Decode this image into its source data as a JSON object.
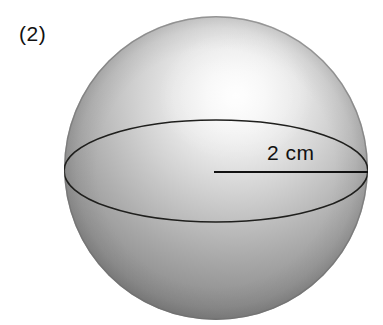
{
  "figure": {
    "type": "geometry-diagram",
    "shape": "sphere",
    "item_number": "(2)",
    "background_color": "#ffffff",
    "width": 383,
    "height": 325
  },
  "labels": {
    "item_number": "(2)",
    "radius_measure": "2 cm"
  },
  "sphere": {
    "name": "shaded-sphere",
    "center_x": 216,
    "center_y": 168,
    "radius": 152,
    "outline_color": "#6e6e6e",
    "highlight_color": "#f2f2f2",
    "mid_tone_color": "#bdbdbd",
    "edge_color": "#777777",
    "highlight_center_x": 236,
    "highlight_center_y": 96
  },
  "equator": {
    "name": "equator-ellipse",
    "center_x": 216,
    "center_y": 171,
    "radius_x": 152,
    "radius_y": 51,
    "stroke_color": "#20201e",
    "stroke_width": 1.6
  },
  "radius_line": {
    "name": "radius-segment",
    "x1": 214,
    "y1": 172,
    "x2": 368,
    "y2": 172,
    "stroke_color": "#111111",
    "stroke_width": 2.2,
    "measure": "2 cm"
  }
}
